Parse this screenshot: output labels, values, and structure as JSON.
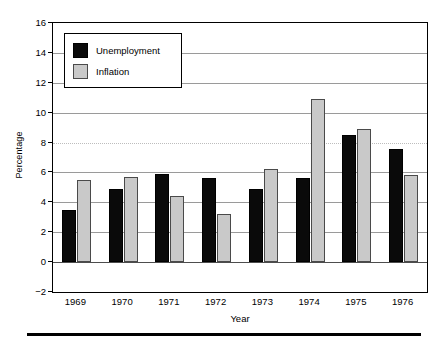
{
  "chart_data": {
    "type": "bar",
    "title": "",
    "xlabel": "Year",
    "ylabel": "Percentage",
    "categories": [
      "1969",
      "1970",
      "1971",
      "1972",
      "1973",
      "1974",
      "1975",
      "1976"
    ],
    "series": [
      {
        "name": "Unemployment",
        "color": "#0a0a0a",
        "values": [
          3.5,
          4.9,
          5.9,
          5.6,
          4.9,
          5.6,
          8.5,
          7.6
        ]
      },
      {
        "name": "Inflation",
        "color": "#c9c9c9",
        "values": [
          5.5,
          5.7,
          4.4,
          3.2,
          6.2,
          10.9,
          8.9,
          5.8
        ]
      }
    ],
    "ylim": [
      -2,
      16
    ],
    "yticks": [
      -2,
      0,
      2,
      4,
      6,
      8,
      10,
      12,
      14,
      16
    ],
    "ytick_labels": [
      "−2",
      "0",
      "2",
      "4",
      "6",
      "8",
      "10",
      "12",
      "14",
      "16"
    ],
    "grid": true,
    "grid_axis": "y",
    "legend_position": "upper left"
  }
}
